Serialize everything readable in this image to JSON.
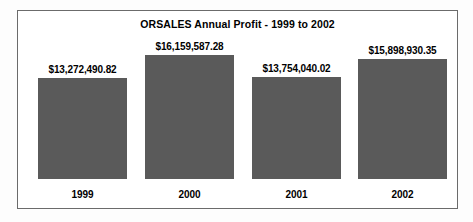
{
  "chart_data": {
    "type": "bar",
    "title": "ORSALES Annual Profit - 1999 to 2002",
    "xlabel": "",
    "ylabel": "",
    "categories": [
      "1999",
      "2000",
      "2001",
      "2002"
    ],
    "values": [
      13272490.82,
      16159587.28,
      13754040.02,
      15898930.35
    ],
    "value_labels": [
      "$13,272,490.82",
      "$16,159,587.28",
      "$13,754,040.02",
      "$15,898,930.35"
    ],
    "ylim": [
      0,
      17000000
    ],
    "grid": false,
    "legend": "none",
    "bar_color": "#5a5a5a",
    "background_color": "#ffffff",
    "border_color": "#6b6b6b",
    "text_color": "#000000"
  },
  "layout": {
    "baseline_y": 168,
    "bar_tops_y": [
      67,
      44,
      66,
      48
    ],
    "bar_lefts_x": [
      20,
      127,
      234,
      340
    ],
    "bar_width": 89,
    "category_label_y": 178
  }
}
